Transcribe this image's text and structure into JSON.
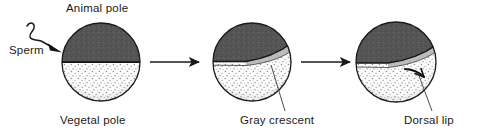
{
  "figure": {
    "background_color": "#ffffff",
    "width": 485,
    "height": 134
  },
  "labels": {
    "animal_pole": "Animal pole",
    "vegetal_pole": "Vegetal pole",
    "sperm": "Sperm",
    "gray_crescent": "Gray crescent",
    "dorsal_lip": "Dorsal lip"
  },
  "colors": {
    "animal_hemisphere": "#555555",
    "vegetal_hemisphere": "#fbfbfb",
    "gray_crescent": "#b9b9b9",
    "outline": "#1a1a1a",
    "text": "#1a1a1a",
    "arrow": "#1a1a1a",
    "stipple": "#8a8a8a"
  },
  "stages": [
    {
      "id": "stage-1",
      "name": "unfertilized-egg-with-sperm",
      "cx": 101,
      "cy": 62,
      "r": 39,
      "has_gray_crescent": false,
      "has_dorsal_lip": false,
      "has_sperm": true
    },
    {
      "id": "stage-2",
      "name": "fertilized-egg-with-gray-crescent",
      "cx": 252,
      "cy": 62,
      "r": 39,
      "has_gray_crescent": true,
      "has_dorsal_lip": false,
      "has_sperm": false
    },
    {
      "id": "stage-3",
      "name": "gastrula-with-dorsal-lip",
      "cx": 396,
      "cy": 62,
      "r": 40,
      "has_gray_crescent": true,
      "has_dorsal_lip": true,
      "has_sperm": false
    }
  ],
  "arrows": [
    {
      "id": "arrow-1",
      "from_stage": "stage-1",
      "to_stage": "stage-2",
      "x1": 150,
      "x2": 199,
      "y": 62
    },
    {
      "id": "arrow-2",
      "from_stage": "stage-2",
      "to_stage": "stage-3",
      "x1": 301,
      "x2": 350,
      "y": 62
    }
  ],
  "leader_lines": [
    {
      "id": "leader-gray-crescent",
      "target": "gray_crescent",
      "x1": 285,
      "y1": 112,
      "x2": 271,
      "y2": 65
    },
    {
      "id": "leader-dorsal-lip",
      "target": "dorsal_lip",
      "x1": 432,
      "y1": 112,
      "x2": 418,
      "y2": 72
    }
  ]
}
